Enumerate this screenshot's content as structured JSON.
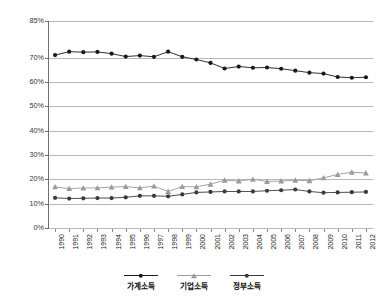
{
  "chart_data": {
    "type": "line",
    "title": "",
    "xlabel": "",
    "ylabel": "",
    "ylim": [
      0,
      85
    ],
    "ytick_labels": [
      "0%",
      "10%",
      "20%",
      "30%",
      "40%",
      "50%",
      "60%",
      "70%",
      "85%"
    ],
    "ytick_values": [
      0,
      10,
      20,
      30,
      40,
      50,
      60,
      70,
      85
    ],
    "grid": true,
    "legend_position": "bottom",
    "categories": [
      "1990",
      "1991",
      "1992",
      "1993",
      "1994",
      "1995",
      "1996",
      "1997",
      "1998",
      "1999",
      "2000",
      "2001",
      "2002",
      "2003",
      "2004",
      "2005",
      "2006",
      "2007",
      "2008",
      "2009",
      "2010",
      "2011",
      "2012"
    ],
    "x": [
      1990,
      1991,
      1992,
      1993,
      1994,
      1995,
      1996,
      1997,
      1998,
      1999,
      2000,
      2001,
      2002,
      2003,
      2004,
      2005,
      2006,
      2007,
      2008,
      2009,
      2010,
      2011,
      2012
    ],
    "series": [
      {
        "name": "가계소득",
        "marker": "filled-circle",
        "color": "#1a1a1a",
        "line_color": "#1a1a1a",
        "values": [
          71.0,
          72.4,
          72.2,
          72.3,
          71.6,
          70.4,
          70.8,
          70.3,
          72.4,
          70.3,
          69.2,
          67.8,
          65.5,
          66.3,
          65.8,
          65.9,
          65.4,
          64.6,
          63.8,
          63.4,
          62.0,
          61.7,
          61.9
        ]
      },
      {
        "name": "기업소득",
        "marker": "triangle",
        "color": "#9a9a9a",
        "line_color": "#9a9a9a",
        "values": [
          16.9,
          16.2,
          16.4,
          16.5,
          16.8,
          17.0,
          16.5,
          17.2,
          15.0,
          17.0,
          16.9,
          18.0,
          19.6,
          19.3,
          20.0,
          19.1,
          19.3,
          19.6,
          19.4,
          20.6,
          22.0,
          22.9,
          22.6
        ]
      },
      {
        "name": "정부소득",
        "marker": "circle",
        "color": "#3a3a3a",
        "line_color": "#3a3a3a",
        "values": [
          12.4,
          12.1,
          12.2,
          12.3,
          12.3,
          12.6,
          13.2,
          13.2,
          13.0,
          13.8,
          14.6,
          14.8,
          15.0,
          15.0,
          15.0,
          15.3,
          15.5,
          15.8,
          15.0,
          14.5,
          14.6,
          14.7,
          14.8
        ]
      }
    ]
  },
  "legend": {
    "items": [
      {
        "label": "가계소득"
      },
      {
        "label": "기업소득"
      },
      {
        "label": "정부소득"
      }
    ]
  }
}
